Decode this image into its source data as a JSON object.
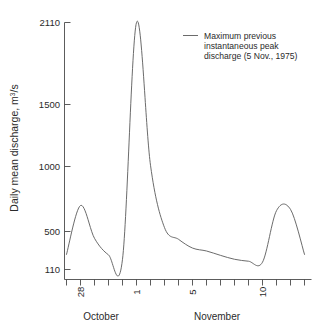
{
  "chart_data": {
    "type": "line",
    "title": "",
    "xlabel": "",
    "ylabel": "Daily mean discharge, m³/s",
    "ylabel_parts": {
      "main": "Daily mean discharge, m",
      "sup": "3",
      "tail": "/s"
    },
    "ylim": [
      110,
      2110
    ],
    "yticks": [
      110,
      500,
      1000,
      1500,
      2110
    ],
    "ytick_labels": [
      "110",
      "500",
      "1000",
      "1500",
      "2110"
    ],
    "y_scale": "piecewise-nonlinear",
    "grid": false,
    "x": [
      "Oct 27",
      "Oct 28",
      "Oct 29",
      "Oct 30",
      "Oct 31",
      "Nov 1",
      "Nov 2",
      "Nov 3",
      "Nov 4",
      "Nov 5",
      "Nov 6",
      "Nov 7",
      "Nov 8",
      "Nov 9",
      "Nov 10",
      "Nov 11",
      "Nov 12",
      "Nov 13"
    ],
    "xtick_labels": [
      "28",
      "1",
      "5",
      "10"
    ],
    "xtick_label_positions": [
      "Oct 28",
      "Nov 1",
      "Nov 5",
      "Nov 10"
    ],
    "xtick_rotation": -90,
    "month_labels": [
      "October",
      "November"
    ],
    "series": [
      {
        "name": "Daily mean discharge",
        "values": [
          265,
          700,
          430,
          260,
          215,
          2110,
          1010,
          530,
          420,
          330,
          300,
          255,
          215,
          195,
          185,
          660,
          670,
          265
        ]
      }
    ],
    "legend": {
      "position": "upper-right",
      "entries": [
        {
          "marker": "line",
          "lines": [
            "Maximum previous",
            "instantaneous peak",
            "discharge (5 Nov., 1975)"
          ],
          "text": "Maximum previous instantaneous peak discharge (5 Nov., 1975)"
        }
      ]
    },
    "colors": {
      "line": "#5a5a5a",
      "axis": "#4a4a4a",
      "text": "#2b2b2b",
      "background": "#ffffff"
    }
  }
}
